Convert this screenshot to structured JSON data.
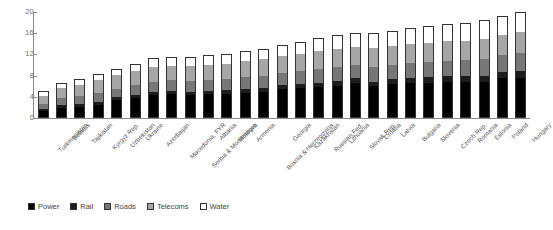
{
  "chart_data": {
    "type": "bar",
    "subtype": "stacked-vertical",
    "title": "",
    "xlabel": "",
    "ylabel": "",
    "ylim": [
      0,
      20
    ],
    "yticks": [
      0,
      4,
      8,
      12,
      16,
      20
    ],
    "grid": false,
    "legend_position": "bottom-left",
    "categories": [
      "Turkmenistan",
      "Belarus",
      "Tajikistan",
      "Kyrgyz Rep.",
      "Uzbekistan",
      "Ukraine",
      "Azerbaijan",
      "Macedonia, FYR",
      "Serbia & Montenegro",
      "Albania",
      "Moldova",
      "Armenia",
      "Bosnia & Herzegovina",
      "Georgia",
      "Kazakhstan",
      "Russian Fed.",
      "Lithuania",
      "Slovak Rep.",
      "Croatia",
      "Latvia",
      "Bulgaria",
      "Slovenia",
      "Czech Rep.",
      "Romania",
      "Estonia",
      "Poland",
      "Hungary"
    ],
    "series": [
      {
        "name": "Power",
        "color": "#000000",
        "values": [
          1.1,
          1.7,
          1.9,
          2.2,
          3.2,
          3.6,
          4.2,
          4.4,
          4.1,
          4.3,
          4.4,
          4.6,
          4.8,
          5.3,
          5.4,
          5.6,
          5.9,
          6.4,
          5.8,
          6.3,
          6.4,
          6.5,
          6.6,
          6.7,
          6.7,
          7.3,
          7.4
        ]
      },
      {
        "name": "Rail",
        "color": "#1c1c1c",
        "values": [
          0.4,
          0.5,
          0.5,
          0.6,
          0.5,
          0.6,
          0.6,
          0.6,
          0.6,
          0.7,
          0.7,
          0.7,
          0.7,
          0.7,
          0.8,
          0.9,
          0.9,
          0.9,
          0.9,
          0.9,
          1.0,
          1.0,
          1.1,
          1.0,
          1.1,
          1.2,
          1.3
        ]
      },
      {
        "name": "Roads",
        "color": "#777777",
        "values": [
          1.0,
          1.3,
          1.5,
          1.7,
          1.6,
          1.8,
          1.9,
          2.0,
          2.1,
          2.0,
          2.1,
          2.2,
          2.3,
          2.3,
          2.4,
          2.5,
          2.6,
          2.6,
          2.7,
          2.7,
          2.8,
          2.8,
          2.9,
          3.0,
          3.1,
          3.2,
          3.4
        ]
      },
      {
        "name": "Telecoms",
        "color": "#a6a6a6",
        "values": [
          1.5,
          2.0,
          2.1,
          2.4,
          2.6,
          2.6,
          2.7,
          2.7,
          2.8,
          2.9,
          2.9,
          3.0,
          3.1,
          3.2,
          3.3,
          3.5,
          3.4,
          3.3,
          3.6,
          3.5,
          3.6,
          3.7,
          3.8,
          3.7,
          3.9,
          3.8,
          4.0
        ]
      },
      {
        "name": "Water",
        "color": "#ffffff",
        "values": [
          0.7,
          0.7,
          0.9,
          1.0,
          1.0,
          1.3,
          1.5,
          1.4,
          1.6,
          1.7,
          1.7,
          1.8,
          1.8,
          1.9,
          2.1,
          2.3,
          2.5,
          2.4,
          2.7,
          2.7,
          2.8,
          2.9,
          3.0,
          3.2,
          3.3,
          3.3,
          3.6
        ]
      }
    ],
    "totals": [
      4.7,
      6.2,
      6.9,
      7.9,
      8.9,
      9.9,
      10.9,
      11.1,
      11.2,
      11.6,
      11.8,
      12.3,
      12.7,
      13.4,
      14.0,
      14.8,
      15.3,
      15.6,
      15.7,
      16.1,
      16.6,
      16.9,
      17.4,
      17.6,
      18.1,
      18.8,
      19.7
    ]
  },
  "legend": {
    "items": [
      {
        "label": "Power"
      },
      {
        "label": "Rail"
      },
      {
        "label": "Roads"
      },
      {
        "label": "Telecoms"
      },
      {
        "label": "Water"
      }
    ]
  }
}
